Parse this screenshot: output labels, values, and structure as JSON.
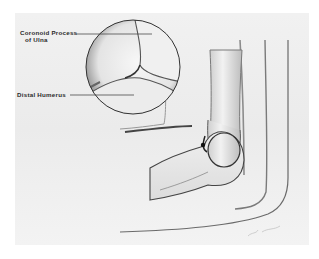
{
  "figure": {
    "labels": {
      "coronoid_line1": "Coronoid Process",
      "coronoid_line2": "of Ulna",
      "distal_humerus": "Distal Humerus"
    },
    "palette": {
      "background": "#ffffff",
      "panel": "#eeeeee",
      "ink": "#2a2a2a",
      "shadow": "#555555"
    }
  }
}
